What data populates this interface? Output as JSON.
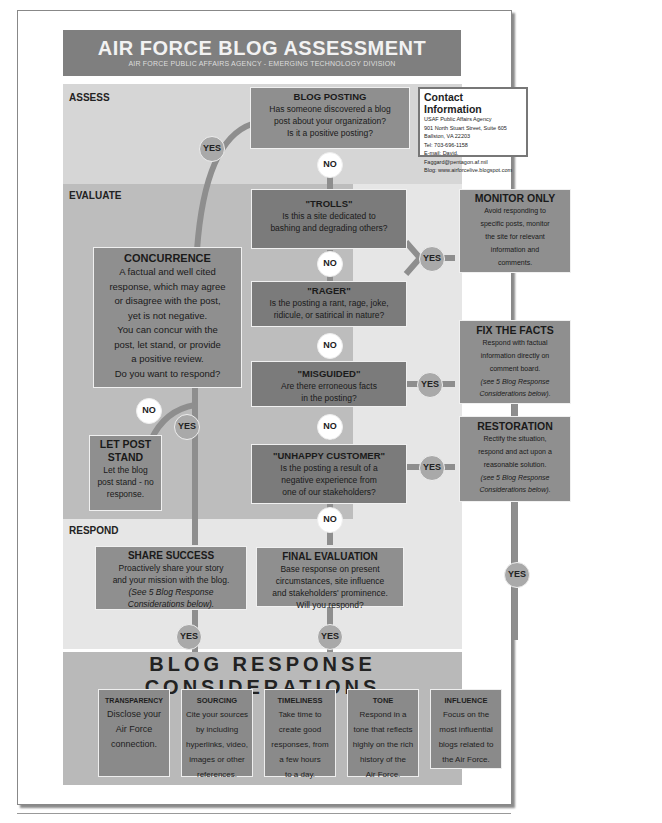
{
  "header": {
    "title": "AIR FORCE BLOG ASSESSMENT",
    "subtitle": "AIR FORCE PUBLIC AFFAIRS AGENCY - EMERGING TECHNOLOGY DIVISION"
  },
  "sections": {
    "assess": "ASSESS",
    "evaluate": "EVALUATE",
    "respond": "RESPOND"
  },
  "contact": {
    "heading": "Contact Information",
    "lines": [
      "USAF Public Affairs Agency",
      "901 North Stuart Street, Suite 605",
      "Ballston, VA 22203",
      "Tel: 703-696-1158",
      "E-mail: David. Faggard@pentagon.af.mil",
      "Blog: www.airforcelive.blogspot.com"
    ]
  },
  "nodes": {
    "blog_posting": {
      "title": "BLOG POSTING",
      "lines": [
        "Has someone discovered a blog",
        "post about your organization?",
        "Is it a positive posting?"
      ]
    },
    "trolls": {
      "title": "\"TROLLS\"",
      "lines": [
        "Is this a site dedicated to",
        "bashing and degrading others?"
      ]
    },
    "rager": {
      "title": "\"RAGER\"",
      "lines": [
        "Is the posting a rant, rage, joke,",
        "ridicule, or satirical in nature?"
      ]
    },
    "misguided": {
      "title": "\"MISGUIDED\"",
      "lines": [
        "Are there erroneous facts",
        "in the posting?"
      ]
    },
    "unhappy_customer": {
      "title": "\"UNHAPPY CUSTOMER\"",
      "lines": [
        "Is the posting a result of a",
        "negative experience from",
        "one of our stakeholders?"
      ]
    },
    "monitor_only": {
      "title": "MONITOR ONLY",
      "lines": [
        "Avoid responding to",
        "specific posts, monitor",
        "the site for relevant",
        "information and",
        "comments."
      ]
    },
    "fix_the_facts": {
      "title": "FIX THE FACTS",
      "lines": [
        "Respond with factual",
        "information directly on",
        "comment board."
      ],
      "note": [
        "(see 5 Blog Response",
        "Considerations below)."
      ]
    },
    "restoration": {
      "title": "RESTORATION",
      "lines": [
        "Rectify the situation,",
        "respond and act upon a",
        "reasonable solution."
      ],
      "note": [
        "(see 5 Blog Response",
        "Considerations below)."
      ]
    },
    "concurrence": {
      "title": "CONCURRENCE",
      "lines": [
        "A factual and well cited",
        "response, which may agree",
        "or disagree with the post,",
        "yet is not negative.",
        "You can concur with the",
        "post, let stand, or provide",
        "a positive review.",
        "Do you want to respond?"
      ]
    },
    "let_post_stand": {
      "title": [
        "LET POST",
        "STAND"
      ],
      "lines": [
        "Let the blog",
        "post stand - no",
        "response."
      ]
    },
    "share_success": {
      "title": "SHARE SUCCESS",
      "lines": [
        "Proactively share your story",
        "and your mission with the blog."
      ],
      "note": [
        "(See 5 Blog Response",
        "Considerations below)."
      ]
    },
    "final_evaluation": {
      "title": "FINAL EVALUATION",
      "lines": [
        "Base response on present",
        "circumstances, site influence",
        "and stakeholders' prominence.",
        "Will you respond?"
      ]
    }
  },
  "connectors": {
    "yes": "YES",
    "no": "NO"
  },
  "considerations": {
    "title": "BLOG RESPONSE CONSIDERATIONS",
    "items": [
      {
        "title": "TRANSPARENCY",
        "lines": [
          "Disclose your",
          "Air Force",
          "connection."
        ]
      },
      {
        "title": "SOURCING",
        "lines": [
          "Cite your sources",
          "by including",
          "hyperlinks, video,",
          "images or other",
          "references."
        ]
      },
      {
        "title": "TIMELINESS",
        "lines": [
          "Take time to",
          "create good",
          "responses, from",
          "a few hours",
          "to a day."
        ]
      },
      {
        "title": "TONE",
        "lines": [
          "Respond in a",
          "tone that reflects",
          "highly on the rich",
          "history of the",
          "Air Force."
        ]
      },
      {
        "title": "INFLUENCE",
        "lines": [
          "Focus on the",
          "most influential",
          "blogs related to",
          "the Air Force."
        ]
      }
    ]
  }
}
